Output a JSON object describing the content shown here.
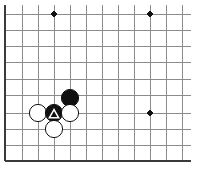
{
  "board": {
    "kind": "go-board-diagram",
    "background_color": "#ffffff",
    "grid": {
      "line_color": "#8c8c8c",
      "line_width": 1,
      "edge_color": "#3a3a3a",
      "edge_width": 2.4,
      "spacing": 16.2,
      "x_lines": [
        5,
        22,
        38,
        54,
        70,
        86,
        102,
        118,
        134,
        150,
        166,
        182
      ],
      "y_lines": [
        14,
        30,
        46,
        62,
        79,
        95,
        113,
        129,
        145,
        161
      ],
      "left_edge_x": 5,
      "bottom_edge_y": 161,
      "clip_right_x": 191,
      "clip_top_y": 5
    },
    "star_points": {
      "color": "#111111",
      "radius": 2.8,
      "points": [
        {
          "name": "star-point-top-left",
          "x": 54,
          "y": 14
        },
        {
          "name": "star-point-top-right",
          "x": 150,
          "y": 14
        },
        {
          "name": "star-point-right-center",
          "x": 150,
          "y": 113
        }
      ]
    },
    "stones": [
      {
        "name": "black-stone-upper",
        "color": "black",
        "fill": "#111111",
        "stroke": "#111111",
        "x": 70,
        "y": 98,
        "radius": 8.6,
        "marker": "none"
      },
      {
        "name": "white-stone-left",
        "color": "white",
        "fill": "#ffffff",
        "stroke": "#111111",
        "x": 38,
        "y": 113,
        "radius": 8.6,
        "marker": "none"
      },
      {
        "name": "black-stone-marked",
        "color": "black",
        "fill": "#111111",
        "stroke": "#111111",
        "x": 54,
        "y": 113,
        "radius": 8.6,
        "marker": "triangle",
        "marker_color": "#ffffff",
        "marker_size": 9.4
      },
      {
        "name": "white-stone-right",
        "color": "white",
        "fill": "#ffffff",
        "stroke": "#111111",
        "x": 70,
        "y": 113,
        "radius": 8.6,
        "marker": "none"
      },
      {
        "name": "white-stone-below",
        "color": "white",
        "fill": "#ffffff",
        "stroke": "#111111",
        "x": 54,
        "y": 129,
        "radius": 8.6,
        "marker": "none"
      }
    ]
  }
}
